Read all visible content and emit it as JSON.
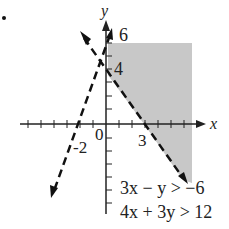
{
  "figure": {
    "bullet": "•",
    "axes": {
      "x_label": "x",
      "y_label": "y",
      "origin_label": "0",
      "tick_labels": {
        "x": [
          "-2",
          "3"
        ],
        "y": [
          "6",
          "4"
        ]
      }
    },
    "inequalities": [
      {
        "text": "3x − y > −6",
        "lhs": "3x − y",
        "op": ">",
        "rhs": "−6"
      },
      {
        "text": "4x + 3y > 12",
        "lhs": "4x + 3y",
        "op": ">",
        "rhs": "12"
      }
    ],
    "shading_color": "#c8c8c8",
    "line_color": "#111111"
  }
}
